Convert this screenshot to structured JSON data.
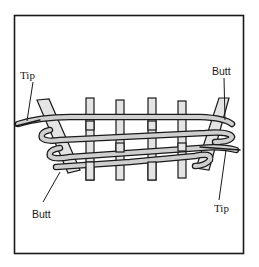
{
  "figure": {
    "colors": {
      "outline": "#1a1a1a",
      "fill": "#cfcfcf",
      "stake_fill": "#e4e4e4",
      "background": "#ffffff"
    },
    "frame": {
      "x": 14,
      "y": 15,
      "width": 229,
      "height": 238
    }
  },
  "labels": {
    "tip_top_left": "Tip",
    "butt_top_right": "Butt",
    "butt_bottom_left": "Butt",
    "tip_bottom_right": "Tip"
  }
}
